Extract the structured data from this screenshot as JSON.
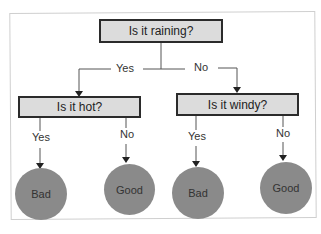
{
  "root": {
    "question": "Is it raining?"
  },
  "edges": {
    "root_yes": "Yes",
    "root_no": "No",
    "hot_yes": "Yes",
    "hot_no": "No",
    "windy_yes": "Yes",
    "windy_no": "No"
  },
  "nodes": {
    "hot": "Is it hot?",
    "windy": "Is it windy?"
  },
  "leaves": [
    {
      "label": "Bad"
    },
    {
      "label": "Good"
    },
    {
      "label": "Bad"
    },
    {
      "label": "Good"
    }
  ],
  "colors": {
    "box_fill": "#dcdcdc",
    "box_border": "#2b2b2b",
    "leaf_fill": "#8a8a8a"
  }
}
